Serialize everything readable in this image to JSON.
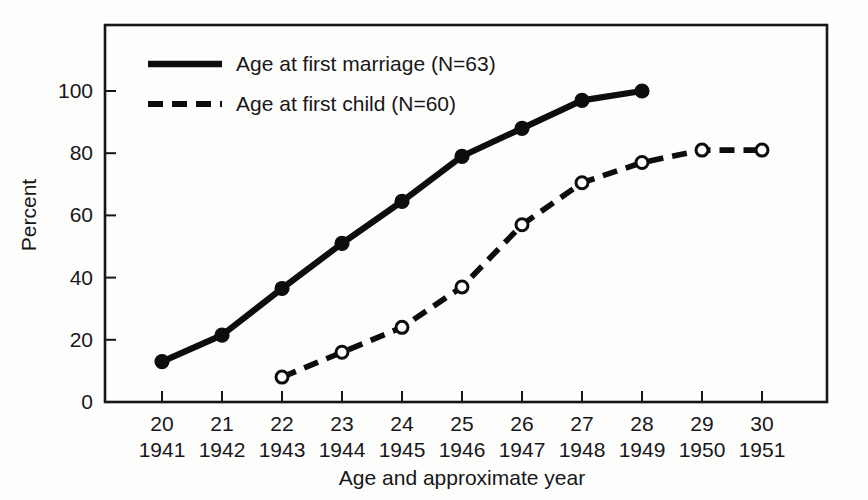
{
  "chart_data": {
    "type": "line",
    "title": "",
    "xlabel": "Age and approximate year",
    "ylabel": "Percent",
    "grid": false,
    "legend_position": "inside-top-left",
    "xlim": [
      20,
      30
    ],
    "ylim": [
      0,
      100
    ],
    "x": [
      20,
      21,
      22,
      23,
      24,
      25,
      26,
      27,
      28,
      29,
      30
    ],
    "x_tick_labels_age": [
      "20",
      "21",
      "22",
      "23",
      "24",
      "25",
      "26",
      "27",
      "28",
      "29",
      "30"
    ],
    "x_tick_labels_year": [
      "1941",
      "1942",
      "1943",
      "1944",
      "1945",
      "1946",
      "1947",
      "1948",
      "1949",
      "1950",
      "1951"
    ],
    "y_tick_labels": [
      "0",
      "20",
      "40",
      "60",
      "80",
      "100"
    ],
    "y_ticks": [
      0,
      20,
      40,
      60,
      80,
      100
    ],
    "series": [
      {
        "name": "Age at first marriage (N=63)",
        "style": "solid",
        "marker": "filled-circle",
        "x": [
          20,
          21,
          22,
          23,
          24,
          25,
          26,
          27,
          28
        ],
        "values": [
          13,
          21.5,
          36.5,
          51,
          64.5,
          79,
          88,
          97,
          100
        ]
      },
      {
        "name": "Age at first child (N=60)",
        "style": "dashed",
        "marker": "open-circle",
        "x": [
          22,
          23,
          24,
          25,
          26,
          27,
          28,
          29,
          30
        ],
        "values": [
          8,
          16,
          24,
          37,
          57,
          70.5,
          77,
          81,
          81
        ]
      }
    ]
  },
  "legend": {
    "items": [
      {
        "label": "Age at first marriage (N=63)",
        "style": "solid"
      },
      {
        "label": "Age at first child (N=60)",
        "style": "dashed"
      }
    ]
  },
  "axes": {
    "y_title": "Percent",
    "x_title": "Age and approximate year"
  },
  "colors": {
    "ink": "#0d0d0f",
    "frame": "#17171a",
    "background": "#fdfdfc"
  }
}
